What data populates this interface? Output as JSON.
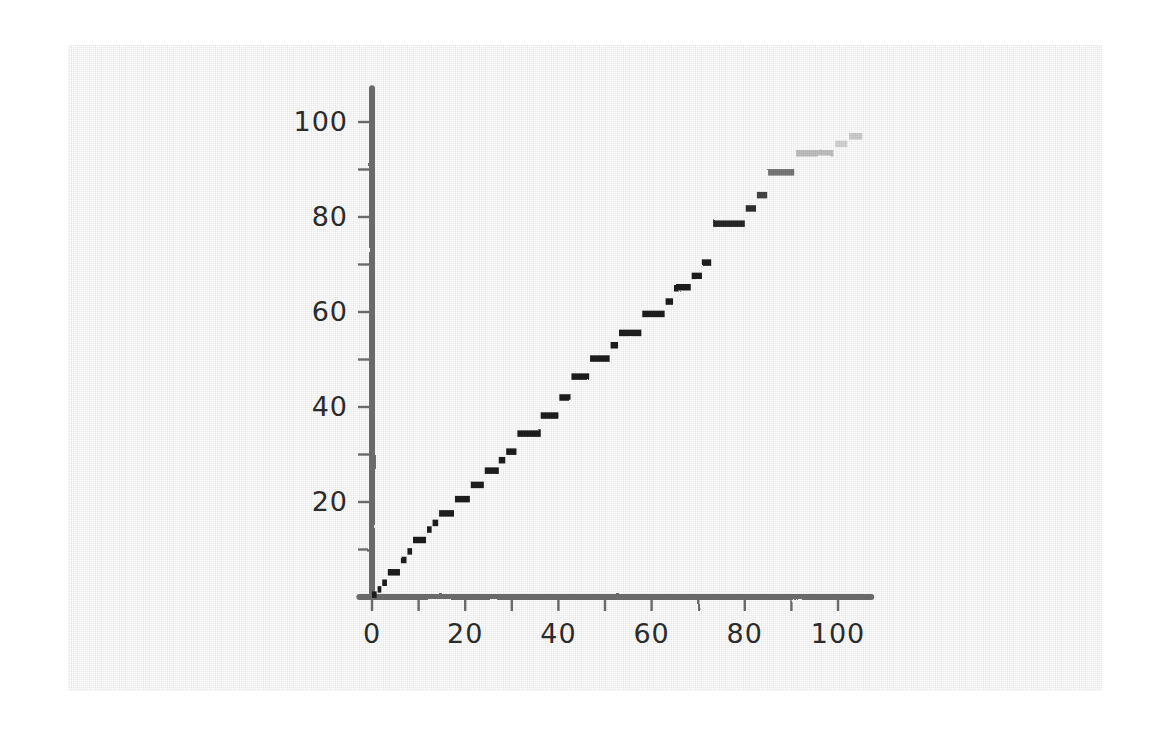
{
  "figure": {
    "background_color": "#ffffff",
    "panel_color": "#ececed",
    "panel": {
      "x": 68,
      "y": 45,
      "width": 1034,
      "height": 646
    },
    "style": "hand-drawn-sketch",
    "axis_color": "#6a6a6a",
    "marker_color": "#1a1a1a"
  },
  "chart_data": {
    "type": "line",
    "render_style": "step-dashes",
    "title": "",
    "subtitle": "",
    "xlabel": "",
    "ylabel": "",
    "xlim": [
      -4,
      108
    ],
    "ylim": [
      -3,
      105
    ],
    "grid": false,
    "legend": null,
    "annotations": [],
    "x_ticks_major": [
      0,
      20,
      40,
      60,
      80,
      100
    ],
    "x_tick_labels": [
      "0",
      "20",
      "40",
      "60",
      "80",
      "100"
    ],
    "x_ticks_minor": [
      10,
      30,
      50,
      70,
      90
    ],
    "y_ticks_major": [
      20,
      40,
      60,
      80,
      100
    ],
    "y_tick_labels": [
      "20",
      "40",
      "60",
      "80",
      "100"
    ],
    "y_ticks_minor": [
      10,
      30,
      50,
      70,
      90
    ],
    "series": [
      {
        "name": "step",
        "color": "#1a1a1a",
        "comment": "Each segment is a horizontal dash: x0,x1 span at constant y. Alpha fades toward the upper right.",
        "segments": [
          {
            "x0": 0.0,
            "x1": 1.0,
            "y": 0.5,
            "alpha": 1.0
          },
          {
            "x0": 1.2,
            "x1": 2.0,
            "y": 1.6,
            "alpha": 1.0
          },
          {
            "x0": 2.2,
            "x1": 3.2,
            "y": 3.0,
            "alpha": 1.0
          },
          {
            "x0": 3.4,
            "x1": 6.0,
            "y": 5.2,
            "alpha": 1.0
          },
          {
            "x0": 6.2,
            "x1": 7.4,
            "y": 7.8,
            "alpha": 1.0
          },
          {
            "x0": 7.6,
            "x1": 8.6,
            "y": 9.6,
            "alpha": 1.0
          },
          {
            "x0": 8.8,
            "x1": 11.6,
            "y": 12.0,
            "alpha": 1.0
          },
          {
            "x0": 11.8,
            "x1": 12.8,
            "y": 14.2,
            "alpha": 1.0
          },
          {
            "x0": 13.0,
            "x1": 14.2,
            "y": 15.6,
            "alpha": 1.0
          },
          {
            "x0": 14.4,
            "x1": 17.6,
            "y": 17.6,
            "alpha": 1.0
          },
          {
            "x0": 17.8,
            "x1": 21.0,
            "y": 20.6,
            "alpha": 1.0
          },
          {
            "x0": 21.2,
            "x1": 24.0,
            "y": 23.6,
            "alpha": 1.0
          },
          {
            "x0": 24.2,
            "x1": 27.0,
            "y": 26.6,
            "alpha": 1.0
          },
          {
            "x0": 27.2,
            "x1": 28.6,
            "y": 28.8,
            "alpha": 1.0
          },
          {
            "x0": 28.8,
            "x1": 31.0,
            "y": 30.6,
            "alpha": 1.0
          },
          {
            "x0": 31.2,
            "x1": 36.0,
            "y": 34.4,
            "alpha": 1.0
          },
          {
            "x0": 36.2,
            "x1": 40.0,
            "y": 38.2,
            "alpha": 1.0
          },
          {
            "x0": 40.2,
            "x1": 42.6,
            "y": 42.0,
            "alpha": 1.0
          },
          {
            "x0": 42.8,
            "x1": 46.6,
            "y": 46.4,
            "alpha": 1.0
          },
          {
            "x0": 46.8,
            "x1": 51.0,
            "y": 50.2,
            "alpha": 1.0
          },
          {
            "x0": 51.2,
            "x1": 52.8,
            "y": 53.0,
            "alpha": 1.0
          },
          {
            "x0": 53.0,
            "x1": 57.8,
            "y": 55.6,
            "alpha": 1.0
          },
          {
            "x0": 58.0,
            "x1": 62.8,
            "y": 59.6,
            "alpha": 1.0
          },
          {
            "x0": 63.0,
            "x1": 64.6,
            "y": 62.2,
            "alpha": 1.0
          },
          {
            "x0": 64.8,
            "x1": 68.4,
            "y": 65.0,
            "alpha": 1.0
          },
          {
            "x0": 68.6,
            "x1": 70.8,
            "y": 67.6,
            "alpha": 1.0
          },
          {
            "x0": 71.0,
            "x1": 73.0,
            "y": 70.4,
            "alpha": 1.0
          },
          {
            "x0": 73.2,
            "x1": 80.0,
            "y": 78.6,
            "alpha": 0.96
          },
          {
            "x0": 80.2,
            "x1": 82.4,
            "y": 81.8,
            "alpha": 0.9
          },
          {
            "x0": 82.6,
            "x1": 84.8,
            "y": 84.6,
            "alpha": 0.82
          },
          {
            "x0": 85.0,
            "x1": 90.6,
            "y": 89.4,
            "alpha": 0.6
          },
          {
            "x0": 91.0,
            "x1": 99.0,
            "y": 93.4,
            "alpha": 0.28
          },
          {
            "x0": 99.4,
            "x1": 102.0,
            "y": 95.4,
            "alpha": 0.16
          },
          {
            "x0": 102.4,
            "x1": 105.2,
            "y": 97.0,
            "alpha": 0.22
          }
        ]
      }
    ]
  }
}
